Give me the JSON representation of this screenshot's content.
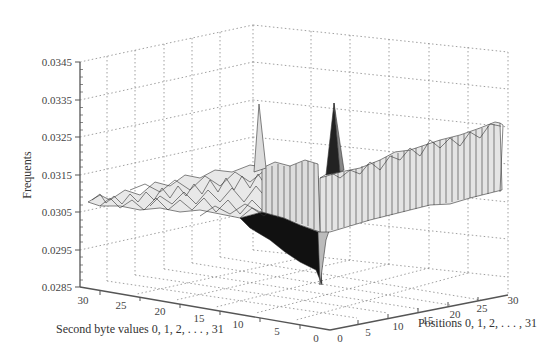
{
  "chart_data": {
    "type": "surface3d",
    "title": "",
    "zlabel": "Frequents",
    "xlabel": "Positions 0, 1, 2, . . . , 31",
    "ylabel": "Second byte values 0, 1, 2, . . . , 31",
    "z_ticks": [
      "0.0345",
      "0.0335",
      "0.0325",
      "0.0315",
      "0.0305",
      "0.0295",
      "0.0285"
    ],
    "zlim": [
      0.0285,
      0.0345
    ],
    "x_ticks": [
      "0",
      "5",
      "10",
      "15",
      "20",
      "25",
      "30"
    ],
    "y_ticks": [
      "30",
      "25",
      "20",
      "15",
      "10",
      "5",
      "0"
    ],
    "xlim": [
      0,
      31
    ],
    "ylim": [
      0,
      31
    ],
    "grid": true,
    "colormap": "grayscale",
    "baseline_level": 0.031,
    "features": [
      {
        "name": "ridge",
        "along": "second_byte=0",
        "positions": [
          1,
          31
        ],
        "values_range": [
          0.0318,
          0.0331
        ]
      },
      {
        "name": "trough",
        "along": "position=0",
        "second_byte_range": [
          0,
          15
        ],
        "min_value": 0.0285
      },
      {
        "name": "spike",
        "position": 0,
        "second_byte": 15,
        "value": 0.0334
      },
      {
        "name": "spike",
        "position": 0,
        "second_byte": 0,
        "value": 0.0335
      }
    ]
  }
}
